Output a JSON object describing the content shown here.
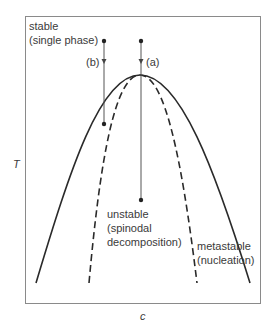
{
  "diagram": {
    "type": "phase-diagram",
    "axes": {
      "x_label": "c",
      "y_label": "T"
    },
    "regions": {
      "stable": [
        "stable",
        "(single phase)"
      ],
      "unstable": [
        "unstable",
        "(spinodal",
        "decomposition)"
      ],
      "metastable": [
        "metastable",
        "(nucleation)"
      ]
    },
    "paths": {
      "a": "(a)",
      "b": "(b)"
    },
    "curves": [
      {
        "name": "binodal",
        "style": "solid"
      },
      {
        "name": "spinodal",
        "style": "dashed"
      }
    ],
    "colors": {
      "line": "#2a2a2a",
      "frame": "#888888",
      "path": "#555555"
    }
  }
}
